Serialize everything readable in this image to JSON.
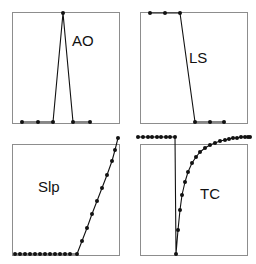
{
  "figure": {
    "background_color": "#ffffff",
    "line_color": "#111111",
    "frame_color": "#8d8d8d",
    "marker_color": "#111111",
    "panel_count": 4,
    "layout": "2x2"
  },
  "chart_data": [
    {
      "type": "line",
      "title": "AO",
      "label": "AO",
      "label_position": {
        "x": 72,
        "y": 46
      },
      "xlabel": "",
      "ylabel": "",
      "grid": false,
      "legend": "none",
      "markers": true,
      "xlim": [
        0,
        10
      ],
      "ylim": [
        0,
        1
      ],
      "x": [
        1,
        2.5,
        3.9,
        5.0,
        6.8,
        8.3
      ],
      "y": [
        0.0,
        0.0,
        0.0,
        1.0,
        0.0,
        0.0
      ],
      "frame": {
        "x": 12,
        "y": 12,
        "width": 108,
        "height": 112
      },
      "points_px": [
        [
          22,
          122
        ],
        [
          38,
          122
        ],
        [
          53,
          122
        ],
        [
          63,
          13
        ],
        [
          73,
          122
        ],
        [
          90,
          122
        ]
      ]
    },
    {
      "type": "line",
      "title": "LS",
      "label": "LS",
      "label_position": {
        "x": 189,
        "y": 63
      },
      "xlabel": "",
      "ylabel": "",
      "grid": false,
      "legend": "none",
      "markers": true,
      "xlim": [
        0,
        10
      ],
      "ylim": [
        0,
        1
      ],
      "x": [
        1.8,
        3.2,
        4.7,
        6.2,
        7.7,
        9.1
      ],
      "y": [
        1.0,
        1.0,
        1.0,
        0.0,
        0.0,
        0.0
      ],
      "frame": {
        "x": 140,
        "y": 12,
        "width": 108,
        "height": 112
      },
      "points_px": [
        [
          150,
          13
        ],
        [
          165,
          13
        ],
        [
          180,
          13
        ],
        [
          195,
          122
        ],
        [
          210,
          122
        ],
        [
          224,
          122
        ]
      ]
    },
    {
      "type": "line",
      "title": "Slp",
      "label": "Slp",
      "label_position": {
        "x": 38,
        "y": 192
      },
      "xlabel": "",
      "ylabel": "",
      "grid": false,
      "legend": "none",
      "markers": true,
      "xlim": [
        0,
        22
      ],
      "ylim": [
        0,
        1
      ],
      "x": [
        0,
        1,
        2,
        3,
        4,
        5,
        6,
        7,
        8,
        9,
        10,
        11,
        12,
        13,
        14,
        15,
        16,
        17,
        18,
        19,
        20,
        21
      ],
      "y": [
        0,
        0,
        0,
        0,
        0,
        0,
        0,
        0,
        0,
        0,
        0,
        0,
        0,
        0.12,
        0.24,
        0.36,
        0.48,
        0.6,
        0.72,
        0.84,
        0.94,
        1.0
      ],
      "frame": {
        "x": 12,
        "y": 144,
        "width": 108,
        "height": 112
      },
      "points_px": [
        [
          15,
          254
        ],
        [
          20,
          254
        ],
        [
          25,
          254
        ],
        [
          30,
          254
        ],
        [
          35,
          254
        ],
        [
          40,
          254
        ],
        [
          45,
          254
        ],
        [
          50,
          254
        ],
        [
          55,
          254
        ],
        [
          60,
          254
        ],
        [
          65,
          254
        ],
        [
          70,
          254
        ],
        [
          77,
          254
        ],
        [
          82,
          241
        ],
        [
          87,
          228
        ],
        [
          92,
          214
        ],
        [
          97,
          201
        ],
        [
          102,
          188
        ],
        [
          107,
          175
        ],
        [
          112,
          161
        ],
        [
          115,
          150
        ],
        [
          118,
          138
        ]
      ]
    },
    {
      "type": "line",
      "title": "TC",
      "label": "TC",
      "label_position": {
        "x": 200,
        "y": 199
      },
      "xlabel": "",
      "ylabel": "",
      "grid": false,
      "legend": "none",
      "markers": true,
      "xlim": [
        0,
        30
      ],
      "ylim": [
        0,
        1
      ],
      "x": [
        0,
        1,
        2,
        3,
        4,
        5,
        6,
        7,
        8,
        9,
        10,
        11,
        12,
        13,
        14,
        15,
        16,
        17,
        18,
        19,
        20,
        21,
        22,
        23,
        24,
        25,
        26,
        27,
        28,
        29
      ],
      "y": [
        1,
        1,
        1,
        1,
        1,
        1,
        1,
        1,
        1,
        0,
        0.22,
        0.4,
        0.53,
        0.64,
        0.72,
        0.79,
        0.84,
        0.88,
        0.91,
        0.93,
        0.95,
        0.96,
        0.97,
        0.98,
        0.985,
        0.99,
        0.993,
        0.996,
        0.998,
        1.0
      ],
      "frame": {
        "x": 140,
        "y": 144,
        "width": 108,
        "height": 112
      },
      "points_px": [
        [
          138,
          137
        ],
        [
          143,
          137
        ],
        [
          148,
          137
        ],
        [
          152,
          137
        ],
        [
          157,
          137
        ],
        [
          161,
          137
        ],
        [
          166,
          137
        ],
        [
          170,
          137
        ],
        [
          175,
          137
        ],
        [
          176,
          254
        ],
        [
          178,
          230
        ],
        [
          180,
          210
        ],
        [
          182,
          195
        ],
        [
          185,
          182
        ],
        [
          188,
          172
        ],
        [
          192,
          163
        ],
        [
          196,
          157
        ],
        [
          200,
          152
        ],
        [
          205,
          148
        ],
        [
          210,
          145
        ],
        [
          215,
          143
        ],
        [
          220,
          141
        ],
        [
          225,
          140
        ],
        [
          229,
          139
        ],
        [
          233,
          138
        ],
        [
          237,
          138
        ],
        [
          241,
          137
        ],
        [
          245,
          137
        ],
        [
          248,
          137
        ],
        [
          250,
          137
        ]
      ]
    }
  ]
}
